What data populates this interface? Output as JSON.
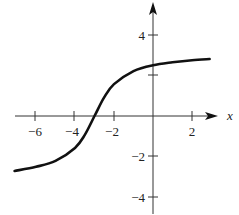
{
  "chart_data": {
    "type": "line",
    "title": "",
    "xlabel": "x",
    "ylabel": "",
    "xlim": [
      -7.1,
      3.3
    ],
    "ylim": [
      -5,
      5.5
    ],
    "x_ticks": [
      -6,
      -4,
      -2,
      2
    ],
    "y_ticks": [
      4,
      2,
      -2,
      -4
    ],
    "x_tick_labels": [
      "−6",
      "−4",
      "−2",
      "2"
    ],
    "y_tick_labels": [
      "4",
      "−2",
      "−4"
    ],
    "grid": false,
    "legend": null,
    "series": [
      {
        "name": "f(x)",
        "description": "S-shaped increasing curve, approx 2*arctan(x+3)",
        "x": [
          -7.1,
          -6,
          -5,
          -4,
          -3.5,
          -3,
          -2.5,
          -2,
          -1,
          0,
          1,
          2,
          2.9
        ],
        "values": [
          -2.71,
          -2.5,
          -2.21,
          -1.57,
          -0.93,
          0.0,
          0.93,
          1.57,
          2.21,
          2.5,
          2.65,
          2.75,
          2.81
        ]
      }
    ]
  },
  "labels": {
    "x_axis": "x",
    "xt_m6": "−6",
    "xt_m4": "−4",
    "xt_m2": "−2",
    "xt_2": "2",
    "yt_4": "4",
    "yt_m2": "−2",
    "yt_m4": "−4"
  }
}
